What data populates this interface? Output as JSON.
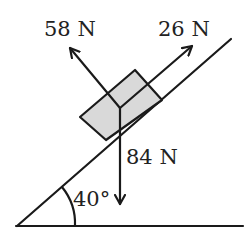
{
  "diagram": {
    "incline_angle_label": "40°",
    "forces": [
      {
        "name": "normal",
        "label": "58 N",
        "direction": "perpendicular-up-left"
      },
      {
        "name": "friction-or-applied",
        "label": "26 N",
        "direction": "up-the-slope"
      },
      {
        "name": "weight",
        "label": "84 N",
        "direction": "down"
      }
    ],
    "colors": {
      "line": "#1a1a1a",
      "block_fill": "#d9d9d9",
      "text": "#222222",
      "background": "#ffffff"
    }
  }
}
